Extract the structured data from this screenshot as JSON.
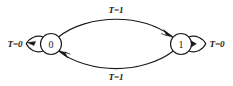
{
  "diagram": {
    "type": "state-transition-diagram",
    "title": "",
    "background_color": "#ffffff",
    "ink_color": "#1a1a1a",
    "states": [
      {
        "id": "s0",
        "label": "0",
        "cx": 51,
        "cy": 44,
        "r": 10.5
      },
      {
        "id": "s1",
        "label": "1",
        "cx": 181,
        "cy": 44,
        "r": 10.5
      }
    ],
    "transitions": [
      {
        "id": "t-self-0",
        "kind": "self-loop",
        "from": "s0",
        "to": "s0",
        "label": "T=0",
        "label_x": 15,
        "label_y": 47,
        "side": "left"
      },
      {
        "id": "t-0-to-1",
        "kind": "arc",
        "from": "s0",
        "to": "s1",
        "label": "T=1",
        "label_x": 116,
        "label_y": 13,
        "side": "top"
      },
      {
        "id": "t-1-to-0",
        "kind": "arc",
        "from": "s1",
        "to": "s0",
        "label": "T=1",
        "label_x": 116,
        "label_y": 80,
        "side": "bottom"
      },
      {
        "id": "t-self-1",
        "kind": "self-loop",
        "from": "s1",
        "to": "s1",
        "label": "T=0",
        "label_x": 217,
        "label_y": 47,
        "side": "right"
      }
    ]
  }
}
